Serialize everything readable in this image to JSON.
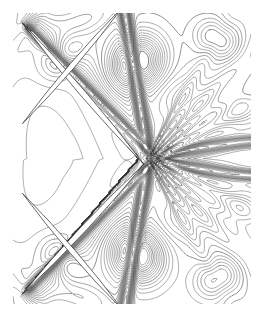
{
  "figure": {
    "title": "",
    "caption": "",
    "background_color": "#ffffff",
    "contour_color": "#3a3a3a",
    "shock_color": "#1a1a1a",
    "body_color": "#ffffff",
    "plot_area": {
      "x": 13,
      "y": 13,
      "width": 238,
      "height": 291
    }
  },
  "chart_data": {
    "type": "contour",
    "title": "",
    "subtitle": "",
    "xlabel": "",
    "ylabel": "",
    "grid": false,
    "legend": "none",
    "axis_ticks": [],
    "tick_labels": [],
    "annotations": [],
    "xlim": [
      0,
      1
    ],
    "ylim": [
      0,
      1
    ],
    "n_levels": 40,
    "level_min": 0.05,
    "level_max": 1.95,
    "level_step": 0.05,
    "symmetry": "mirror-horizontal about y=0.5",
    "bodies": [
      {
        "name": "upper-blade",
        "leading_edge": [
          0.04,
          0.035
        ],
        "trailing_edge": [
          0.55,
          0.52
        ],
        "thickness": 0.022,
        "chord_angle_deg": 43
      },
      {
        "name": "lower-blade",
        "leading_edge": [
          0.04,
          0.965
        ],
        "trailing_edge": [
          0.55,
          0.52
        ],
        "thickness": 0.022,
        "chord_angle_deg": -43
      },
      {
        "name": "upper-blade-periodic",
        "leading_edge": [
          0.04,
          0.62
        ],
        "trailing_edge": [
          0.46,
          1.02
        ],
        "thickness": 0.02,
        "chord_angle_deg": 43
      },
      {
        "name": "lower-blade-periodic",
        "leading_edge": [
          0.04,
          0.38
        ],
        "trailing_edge": [
          0.46,
          -0.02
        ],
        "thickness": 0.02,
        "chord_angle_deg": -43
      }
    ],
    "features": [
      {
        "name": "leading-edge-shock-upper",
        "x": 0.04,
        "y": 0.035,
        "type": "bow-shock"
      },
      {
        "name": "leading-edge-shock-lower",
        "x": 0.04,
        "y": 0.965,
        "type": "bow-shock"
      },
      {
        "name": "trailing-edge-shock-fan",
        "x": 0.55,
        "y": 0.52,
        "type": "shock-fan"
      },
      {
        "name": "wake-upper",
        "x0": 0.55,
        "y0": 0.49,
        "x1": 1.0,
        "y1": 0.47,
        "type": "wake"
      },
      {
        "name": "wake-lower",
        "x0": 0.55,
        "y0": 0.55,
        "x1": 1.0,
        "y1": 0.57,
        "type": "wake"
      },
      {
        "name": "suction-peak-upper",
        "x": 0.52,
        "y": 0.17,
        "type": "closed-contour-cluster"
      },
      {
        "name": "suction-peak-lower",
        "x": 0.52,
        "y": 0.83,
        "type": "closed-contour-cluster"
      },
      {
        "name": "vortex-core-upper-left",
        "x": 0.21,
        "y": 0.15,
        "type": "closed-contour-cluster"
      },
      {
        "name": "vortex-core-lower-left",
        "x": 0.21,
        "y": 0.85,
        "type": "closed-contour-cluster"
      },
      {
        "name": "outflow-pocket-upper",
        "x": 0.85,
        "y": 0.1,
        "type": "closed-contour"
      },
      {
        "name": "outflow-pocket-lower",
        "x": 0.85,
        "y": 0.9,
        "type": "closed-contour"
      }
    ]
  }
}
